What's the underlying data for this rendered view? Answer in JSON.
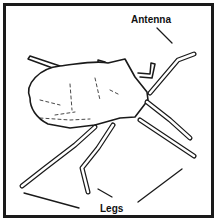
{
  "diagram": {
    "labels": {
      "antenna": "Antenna",
      "legs": "Legs"
    },
    "colors": {
      "ink": "#1a1a1a",
      "background": "#ffffff"
    }
  }
}
